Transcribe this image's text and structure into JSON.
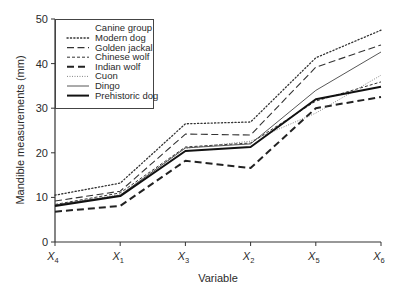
{
  "chart_data": {
    "type": "line",
    "title": "",
    "xlabel": "Variable",
    "ylabel": "Mandible measurements (mm)",
    "categories": [
      {
        "main": "X",
        "sub": "4"
      },
      {
        "main": "X",
        "sub": "1"
      },
      {
        "main": "X",
        "sub": "3"
      },
      {
        "main": "X",
        "sub": "2"
      },
      {
        "main": "X",
        "sub": "5"
      },
      {
        "main": "X",
        "sub": "6"
      }
    ],
    "ylim": [
      0,
      50
    ],
    "yticks": [
      0,
      10,
      20,
      30,
      40,
      50
    ],
    "grid": false,
    "legend": {
      "title": "Canine group",
      "placement": "top-left"
    },
    "series": [
      {
        "name": "Modern dog",
        "style": "dotted",
        "values": [
          10.5,
          13.2,
          26.5,
          26.9,
          41.3,
          47.5
        ]
      },
      {
        "name": "Golden jackal",
        "style": "long-dash",
        "values": [
          9.2,
          11.4,
          24.2,
          24.0,
          39.2,
          44.2
        ]
      },
      {
        "name": "Chinese wolf",
        "style": "short-dash",
        "values": [
          8.4,
          11.0,
          21.3,
          22.2,
          31.6,
          35.9
        ]
      },
      {
        "name": "Indian wolf",
        "style": "thick-dash",
        "values": [
          6.8,
          8.1,
          18.2,
          16.6,
          30.0,
          32.5
        ]
      },
      {
        "name": "Cuon",
        "style": "fine-dotted",
        "values": [
          8.3,
          10.6,
          21.0,
          22.6,
          28.9,
          37.4
        ]
      },
      {
        "name": "Dingo",
        "style": "thin-solid",
        "values": [
          8.3,
          10.5,
          21.1,
          22.0,
          34.0,
          42.6
        ]
      },
      {
        "name": "Prehistoric dog",
        "style": "thick-solid",
        "values": [
          8.1,
          10.3,
          20.4,
          21.3,
          32.0,
          34.8
        ]
      }
    ]
  }
}
